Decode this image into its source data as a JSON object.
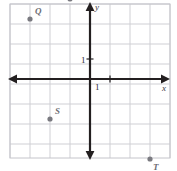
{
  "chart_data": {
    "type": "scatter",
    "title": "",
    "xlabel": "x",
    "ylabel": "y",
    "grid": true,
    "legend": false,
    "xlim": [
      -4,
      4
    ],
    "ylim": [
      -4,
      4
    ],
    "x_tick_labels": [
      "1"
    ],
    "y_tick_labels": [
      "1"
    ],
    "unit_tick_value": "1",
    "points": [
      {
        "label": "Q",
        "x": -3,
        "y": 3
      },
      {
        "label": "R",
        "x": -1,
        "y": 4
      },
      {
        "label": "S",
        "x": -2,
        "y": -2
      },
      {
        "label": "T",
        "x": 3,
        "y": -4
      }
    ]
  },
  "plot": {
    "geometry": {
      "origin_x": 90,
      "origin_y": 79,
      "cell": 20,
      "grid_left": 10,
      "grid_right": 170,
      "grid_top": 4,
      "grid_bottom": 158
    },
    "point_label_offsets": {
      "Q": {
        "dx": 5,
        "dy": -12
      },
      "R": {
        "dx": 5,
        "dy": -12
      },
      "S": {
        "dx": 5,
        "dy": -12
      },
      "T": {
        "dx": 3,
        "dy": 4
      }
    },
    "axis_name_positions": {
      "x": {
        "left": 162,
        "top": 84
      },
      "y": {
        "left": 95,
        "top": 3
      }
    },
    "tick_label_positions": {
      "x_one": {
        "left": 95,
        "top": 83
      },
      "y_one": {
        "left": 81,
        "top": 56
      }
    }
  },
  "colors": {
    "background": "#ffffff",
    "grid_line": "#cfcfd4",
    "grid_border": "#c4c4ca",
    "axis": "#231f20",
    "point_fill": "#7a7a80",
    "point_label": "#6d6d73",
    "tick_text": "#2b2b2e",
    "axis_name": "#3a3a3e"
  },
  "icons": {
    "x_axis_arrow_right": "arrow-right-icon",
    "x_axis_arrow_left": "arrow-left-icon",
    "y_axis_arrow_up": "arrow-up-icon",
    "y_axis_arrow_down": "arrow-down-icon"
  }
}
